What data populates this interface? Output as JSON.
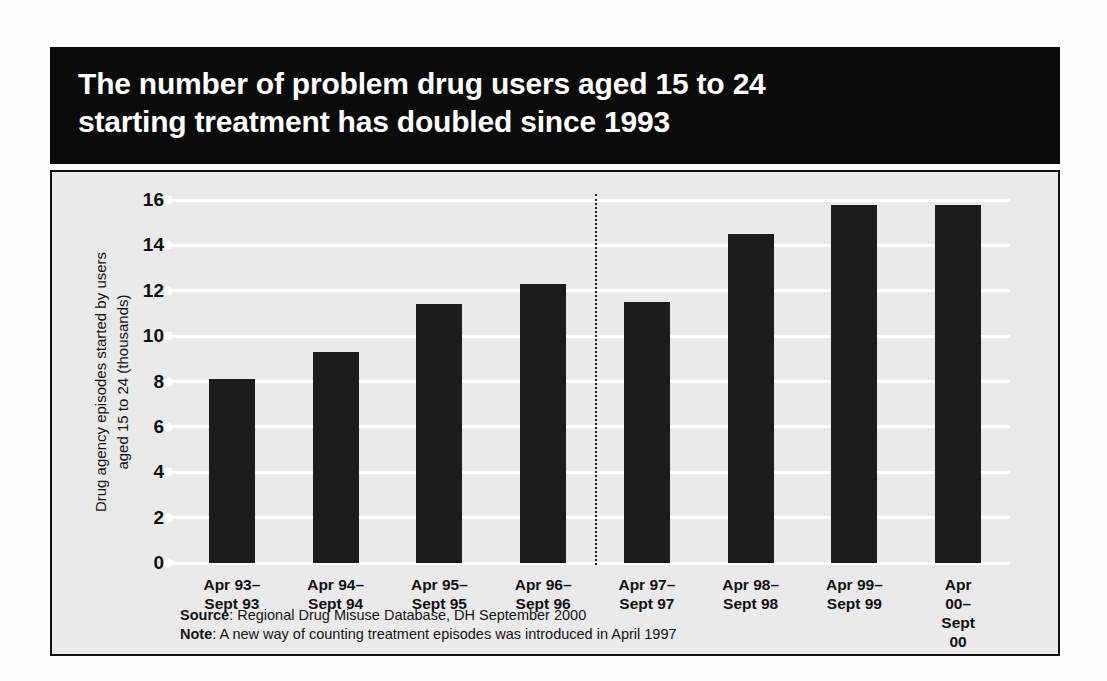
{
  "title": "The number of problem drug users aged 15 to 24\nstarting treatment has doubled since 1993",
  "footnotes": {
    "source_label": "Source",
    "source_text": ": Regional Drug Misuse Database, DH September 2000",
    "note_label": "Note",
    "note_text": ": A new way of counting treatment episodes was introduced in April 1997"
  },
  "colors": {
    "bar": "#1c1c1c",
    "banner_background": "#0b0b0b",
    "banner_text": "#ffffff",
    "panel_background": "#eaeaea",
    "gridline": "#ffffff",
    "panel_border": "#111111"
  },
  "chart_data": {
    "type": "bar",
    "title": "The number of problem drug users aged 15 to 24 starting treatment has doubled since 1993",
    "xlabel": "",
    "ylabel": "Drug agency episodes started by users\naged 15 to 24 (thousands)",
    "categories": [
      "Apr 93–\nSept 93",
      "Apr 94–\nSept 94",
      "Apr 95–\nSept 95",
      "Apr 96–\nSept 96",
      "Apr 97–\nSept 97",
      "Apr 98–\nSept 98",
      "Apr 99–\nSept 99",
      "Apr 00–\nSept 00"
    ],
    "values": [
      8.1,
      9.3,
      11.4,
      12.3,
      11.5,
      14.5,
      15.8,
      15.8
    ],
    "ylim": [
      0,
      16
    ],
    "yticks": [
      0,
      2,
      4,
      6,
      8,
      10,
      12,
      14,
      16
    ],
    "ytick_labels": [
      "0",
      "2",
      "4",
      "6",
      "8",
      "10",
      "12",
      "14",
      "16"
    ],
    "grid": true,
    "legend": "none",
    "annotations": [
      {
        "type": "vertical-dotted-line",
        "after_category_index": 3,
        "meaning": "A new way of counting treatment episodes was introduced in April 1997"
      }
    ]
  }
}
